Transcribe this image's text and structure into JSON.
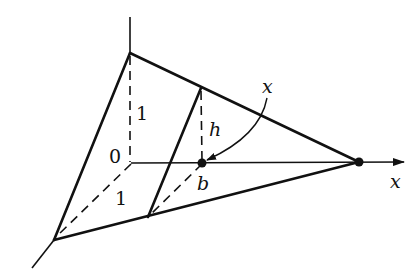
{
  "figure": {
    "labels": {
      "height_one": "1",
      "origin": "0",
      "depth_one": "1",
      "slice_height": "h",
      "slice_position": "b",
      "pointer_variable": "x",
      "axis_variable": "x"
    },
    "colors": {
      "ink": "#111111",
      "background": "#ffffff"
    }
  }
}
